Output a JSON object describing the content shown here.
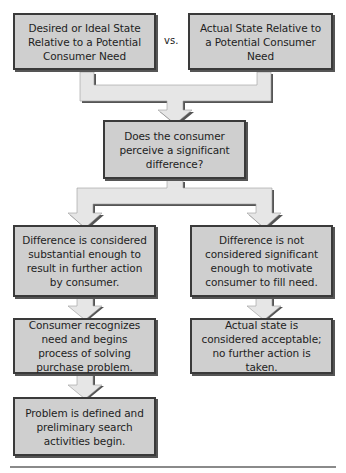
{
  "diagram": {
    "nodes": {
      "desired_state": "Desired or Ideal State Relative to a Potential Consumer Need",
      "actual_state": "Actual State Relative to a Potential Consumer Need",
      "question": "Does the consumer perceive a significant difference?",
      "substantial": "Difference is considered substantial enough to result in further action by consumer.",
      "not_significant": "Difference is not considered significant enough to motivate consumer to fill need.",
      "recognizes_need": "Consumer recognizes need and begins process of solving purchase problem.",
      "acceptable": "Actual state is considered acceptable; no further action is taken.",
      "problem_defined": "Problem is defined and preliminary search activities begin."
    },
    "vs_label": "vs.",
    "edges": [
      {
        "from": "desired_state",
        "to": "question"
      },
      {
        "from": "actual_state",
        "to": "question"
      },
      {
        "from": "question",
        "to": "substantial"
      },
      {
        "from": "question",
        "to": "not_significant"
      },
      {
        "from": "substantial",
        "to": "recognizes_need"
      },
      {
        "from": "not_significant",
        "to": "acceptable"
      },
      {
        "from": "recognizes_need",
        "to": "problem_defined"
      }
    ],
    "colors": {
      "box_fill": "#cfcfcf",
      "box_border": "#3a3a3a",
      "arrow_fill": "#e6e6e6",
      "arrow_shadow": "#555555"
    }
  }
}
